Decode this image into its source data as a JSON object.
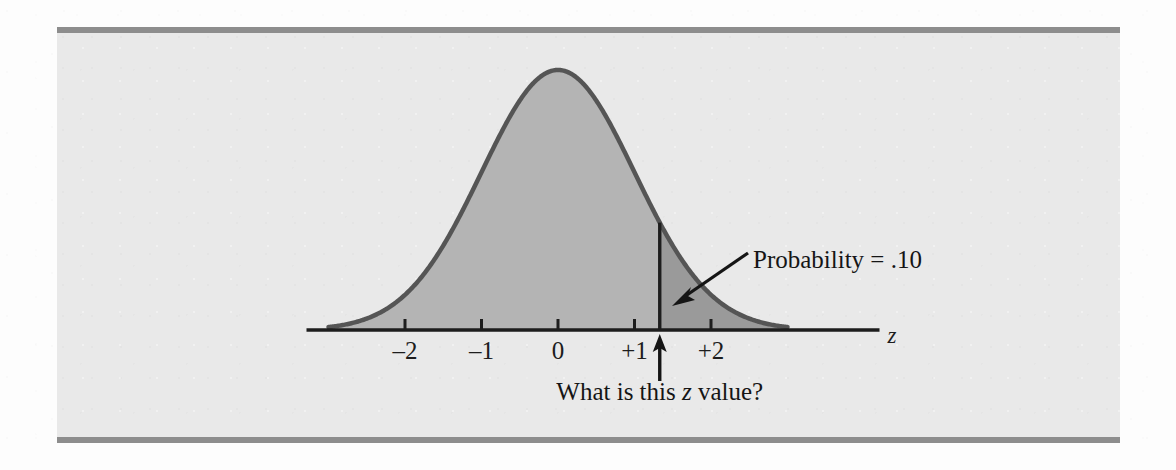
{
  "figure": {
    "background_color": "#e9e9e9",
    "rule_color": "#8d8d8d",
    "curve_line_color": "#555555",
    "body_fill_color": "#b4b4b4",
    "tail_fill_color": "#9a9a9a",
    "axis_color": "#1d1d1d"
  },
  "annotations": {
    "probability_label": "Probability = .10",
    "question_prefix": "What is this ",
    "question_variable": "z",
    "question_suffix": " value?"
  },
  "chart_data": {
    "type": "line",
    "title": "",
    "subtitle": "",
    "xlabel": "z",
    "ylabel": "",
    "grid": false,
    "legend": null,
    "distribution": "standard normal",
    "mean": 0,
    "sd": 1,
    "xlim": [
      -3.0,
      3.0
    ],
    "ylim": [
      0,
      0.42
    ],
    "x_tick_values": [
      -2,
      -1,
      0,
      1,
      2
    ],
    "x_tick_labels": [
      "–2",
      "–1",
      "0",
      "+1",
      "+2"
    ],
    "axis_label": "z",
    "shaded_regions": [
      {
        "name": "body",
        "from": -3.0,
        "to": 1.33,
        "fill": "#b4b4b4",
        "area": 0.9
      },
      {
        "name": "upper-tail",
        "from": 1.33,
        "to": 3.0,
        "fill": "#9a9a9a",
        "area": 0.1,
        "label": "Probability = .10"
      }
    ],
    "marker_line": {
      "z": 1.33,
      "label": "unknown z value",
      "pointer": "up-arrow"
    },
    "curve_points_x": [
      -3.0,
      -2.75,
      -2.5,
      -2.25,
      -2.0,
      -1.75,
      -1.5,
      -1.25,
      -1.0,
      -0.75,
      -0.5,
      -0.25,
      0.0,
      0.25,
      0.5,
      0.75,
      1.0,
      1.25,
      1.5,
      1.75,
      2.0,
      2.25,
      2.5,
      2.75,
      3.0
    ],
    "curve_points_y": [
      0.0044,
      0.0091,
      0.0175,
      0.0317,
      0.054,
      0.0863,
      0.1295,
      0.1826,
      0.242,
      0.3011,
      0.3521,
      0.3867,
      0.3989,
      0.3867,
      0.3521,
      0.3011,
      0.242,
      0.1826,
      0.1295,
      0.0863,
      0.054,
      0.0317,
      0.0175,
      0.0091,
      0.0044
    ]
  }
}
